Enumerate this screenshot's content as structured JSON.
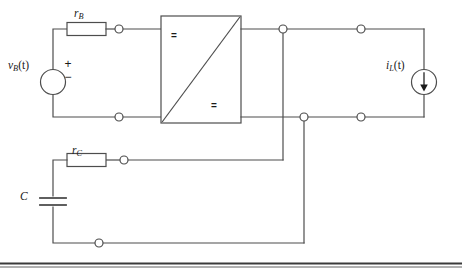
{
  "figure": {
    "kind": "circuit-schematic",
    "line_color": "#4d4d4d",
    "text_color": "#1a1a1a",
    "background": "#ffffff",
    "rule_color": "#3a3a3a"
  },
  "labels": {
    "source_voltage": {
      "base": "v",
      "sub": "B",
      "arg": "(t)"
    },
    "load_current": {
      "base": "i",
      "sub": "L",
      "arg": "(t)"
    },
    "resistor_b": {
      "base": "r",
      "sub": "B"
    },
    "resistor_c": {
      "base": "r",
      "sub": "C"
    },
    "capacitor": {
      "base": "C"
    }
  },
  "converter": {
    "input_symbol": "=",
    "output_symbol": "=",
    "description": "DC to DC converter block"
  },
  "source_symbols": {
    "plus": "+",
    "minus": "−"
  },
  "terminals": {
    "count": 10,
    "style": "open-circle"
  }
}
